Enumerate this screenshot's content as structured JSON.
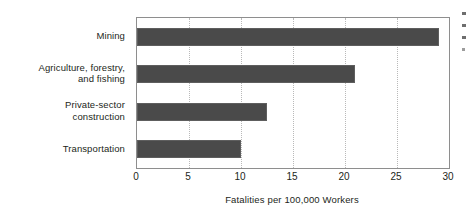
{
  "chart_data": {
    "type": "bar",
    "orientation": "horizontal",
    "title": "",
    "subtitle": "",
    "categories": [
      "Mining",
      "Agriculture, forestry, and fishing",
      "Private-sector construction",
      "Transportation"
    ],
    "category_lines": [
      [
        "Mining"
      ],
      [
        "Agriculture, forestry,",
        "and fishing"
      ],
      [
        "Private-sector",
        "construction"
      ],
      [
        "Transportation"
      ]
    ],
    "values": [
      29,
      21,
      12.5,
      10
    ],
    "xlabel": "Fatalities per 100,000 Workers",
    "ylabel": "",
    "xlim": [
      0,
      30
    ],
    "xticks": [
      0,
      5,
      10,
      15,
      20,
      25,
      30
    ],
    "xtick_labels": [
      "0",
      "5",
      "10",
      "15",
      "20",
      "25",
      "30"
    ],
    "grid": true,
    "grid_axis": "x",
    "grid_style": "dotted",
    "legend": false,
    "legend_position": "none",
    "bar_color": "#4a4a4a",
    "bar_edge_color": "#5e5e5e",
    "grid_color": "#b9b9b9",
    "plot_border_color": "#8e8e8e",
    "background_color": "#ffffff",
    "text_color": "#231f20"
  },
  "figure": {
    "axis_title": "Fatalities per 100,000 Workers"
  }
}
